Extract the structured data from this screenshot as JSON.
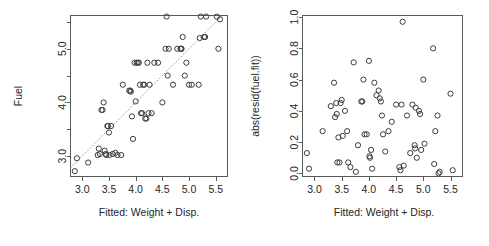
{
  "figure": {
    "background": "#ffffff",
    "foreground": "#262626",
    "point_color": "#3c3c3c",
    "line_color": "#8a8a8a",
    "frame_color": "#5a5a5a"
  },
  "chart_data": [
    {
      "type": "scatter",
      "panel": "left",
      "title": "",
      "xlabel": "Fitted: Weight + Disp.",
      "ylabel": "Fuel",
      "xlim": [
        2.78,
        5.72
      ],
      "ylim": [
        2.62,
        5.62
      ],
      "xticks": [
        "3.0",
        "3.5",
        "4.0",
        "4.5",
        "5.0",
        "5.5"
      ],
      "xtickvalues": [
        3.0,
        3.5,
        4.0,
        4.5,
        5.0,
        5.5
      ],
      "yticks": [
        "3.0",
        "4.0",
        "5.0"
      ],
      "ytickvalues": [
        3.0,
        4.0,
        5.0
      ],
      "yminorticks": [
        2.5,
        3.5,
        4.5,
        5.5
      ],
      "grid": false,
      "legend": null,
      "reference_line": {
        "type": "abline",
        "style": "dotted",
        "intercept": 0,
        "slope": 1,
        "x_from": 2.78,
        "x_to": 5.62
      },
      "x": [
        2.86,
        2.9,
        3.11,
        3.29,
        3.31,
        3.33,
        3.36,
        3.38,
        3.4,
        3.42,
        3.44,
        3.45,
        3.47,
        3.48,
        3.5,
        3.51,
        3.54,
        3.57,
        3.62,
        3.66,
        3.73,
        3.76,
        3.88,
        3.9,
        3.91,
        3.93,
        3.95,
        3.98,
        4.0,
        4.02,
        4.04,
        4.06,
        4.08,
        4.1,
        4.12,
        4.14,
        4.16,
        4.18,
        4.2,
        4.22,
        4.24,
        4.26,
        4.3,
        4.35,
        4.42,
        4.5,
        4.56,
        4.58,
        4.6,
        4.62,
        4.7,
        4.78,
        4.84,
        4.85,
        4.86,
        4.88,
        4.92,
        4.95,
        5.0,
        5.05,
        5.18,
        5.2,
        5.22,
        5.28,
        5.3,
        5.32,
        5.52,
        5.55,
        5.58
      ],
      "y": [
        2.72,
        2.96,
        2.88,
        3.02,
        3.14,
        3.04,
        3.86,
        3.86,
        4.0,
        3.1,
        3.04,
        3.02,
        3.56,
        3.56,
        3.44,
        3.02,
        3.56,
        3.04,
        3.06,
        3.02,
        3.02,
        4.33,
        4.22,
        4.22,
        4.2,
        3.74,
        3.32,
        4.74,
        4.02,
        4.74,
        4.74,
        4.74,
        4.33,
        3.8,
        3.8,
        4.33,
        4.33,
        3.7,
        3.7,
        4.74,
        3.8,
        4.33,
        3.8,
        4.74,
        4.74,
        4.0,
        5.0,
        5.6,
        4.5,
        5.0,
        4.33,
        5.0,
        5.0,
        5.0,
        5.0,
        5.22,
        4.5,
        4.74,
        4.33,
        4.33,
        4.33,
        5.2,
        5.6,
        5.22,
        5.22,
        5.6,
        5.6,
        5.0,
        5.55
      ]
    },
    {
      "type": "scatter",
      "panel": "right",
      "title": "",
      "xlabel": "Fitted: Weight + Disp.",
      "ylabel": "abs(resid(fuel.fit))",
      "xlim": [
        2.78,
        5.72
      ],
      "ylim": [
        -0.02,
        1.01
      ],
      "xticks": [
        "3.0",
        "3.5",
        "4.0",
        "4.5",
        "5.0",
        "5.5"
      ],
      "xtickvalues": [
        3.0,
        3.5,
        4.0,
        4.5,
        5.0,
        5.5
      ],
      "yticks": [
        "0.0",
        "0.2",
        "0.4",
        "0.6",
        "0.8",
        "1.0"
      ],
      "ytickvalues": [
        0.0,
        0.2,
        0.4,
        0.6,
        0.8,
        1.0
      ],
      "grid": false,
      "legend": null,
      "reference_line": null,
      "x": [
        2.86,
        2.9,
        3.15,
        3.3,
        3.36,
        3.38,
        3.4,
        3.41,
        3.42,
        3.44,
        3.46,
        3.48,
        3.5,
        3.52,
        3.56,
        3.6,
        3.62,
        3.66,
        3.72,
        3.76,
        3.8,
        3.86,
        3.88,
        3.9,
        3.92,
        3.96,
        4.0,
        4.01,
        4.02,
        4.04,
        4.06,
        4.1,
        4.14,
        4.18,
        4.2,
        4.22,
        4.24,
        4.26,
        4.3,
        4.36,
        4.42,
        4.5,
        4.56,
        4.58,
        4.6,
        4.62,
        4.64,
        4.7,
        4.76,
        4.8,
        4.84,
        4.85,
        4.86,
        4.88,
        4.92,
        4.94,
        4.96,
        5.0,
        5.02,
        5.18,
        5.2,
        5.22,
        5.26,
        5.28,
        5.3,
        5.5,
        5.54
      ],
      "y": [
        0.13,
        0.03,
        0.27,
        0.43,
        0.58,
        0.36,
        0.45,
        0.38,
        0.07,
        0.23,
        0.07,
        0.45,
        0.47,
        0.24,
        0.4,
        0.27,
        0.07,
        0.04,
        0.71,
        0.01,
        0.18,
        0.46,
        0.46,
        0.6,
        0.25,
        0.25,
        0.72,
        0.11,
        0.1,
        0.15,
        0.03,
        0.58,
        0.5,
        0.53,
        0.48,
        0.46,
        0.37,
        0.25,
        0.14,
        0.27,
        0.33,
        0.44,
        0.04,
        0.02,
        0.44,
        0.97,
        0.05,
        0.37,
        0.13,
        0.44,
        0.18,
        0.16,
        0.42,
        0.1,
        0.4,
        0.38,
        0.15,
        0.6,
        0.19,
        0.8,
        0.06,
        0.27,
        0.37,
        0.0,
        0.01,
        0.51,
        0.02
      ]
    }
  ]
}
